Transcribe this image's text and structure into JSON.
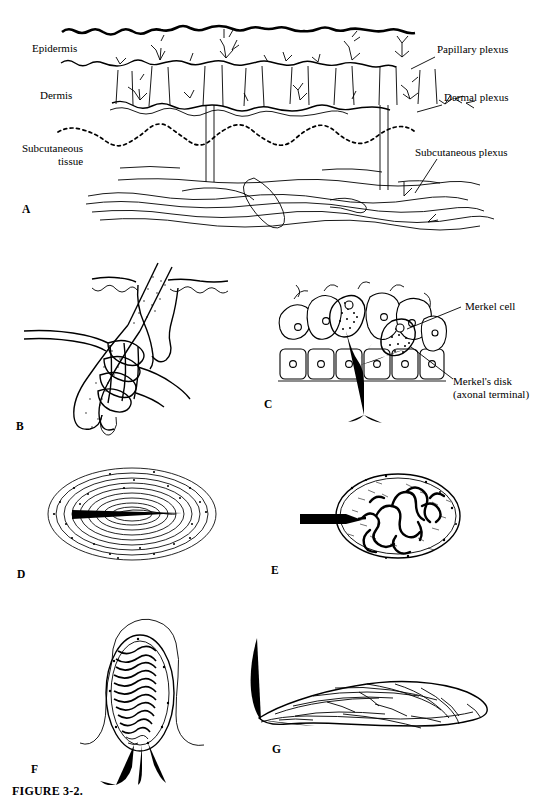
{
  "figure": {
    "caption": "FIGURE 3-2.",
    "background_color": "#ffffff",
    "ink_color": "#000000"
  },
  "panels": [
    {
      "letter": "A",
      "title": "Cutaneous nerve plexuses in skin cross-section",
      "left_labels": [
        {
          "text": "Epidermis"
        },
        {
          "text": "Dermis"
        },
        {
          "text": "Subcutaneous",
          "text2": "tissue"
        }
      ],
      "right_labels": [
        {
          "text": "Papillary plexus"
        },
        {
          "text": "Dermal plexus"
        },
        {
          "text": "Subcutaneous plexus"
        }
      ]
    },
    {
      "letter": "B",
      "title": "Hair follicle receptor"
    },
    {
      "letter": "C",
      "title": "Merkel cell complex in epidermis",
      "labels": [
        {
          "text": "Merkel cell"
        },
        {
          "text": "Merkel's disk",
          "text2": "(axonal terminal)"
        }
      ]
    },
    {
      "letter": "D",
      "title": "Pacinian corpuscle"
    },
    {
      "letter": "E",
      "title": "Ruffini ending"
    },
    {
      "letter": "F",
      "title": "Meissner corpuscle"
    },
    {
      "letter": "G",
      "title": "Free nerve ending plate receptor"
    }
  ],
  "labels": {
    "epidermis": "Epidermis",
    "dermis": "Dermis",
    "subcutaneous_line1": "Subcutaneous",
    "subcutaneous_line2": "tissue",
    "papillary_plexus": "Papillary plexus",
    "dermal_plexus": "Dermal plexus",
    "subcutaneous_plexus": "Subcutaneous plexus",
    "merkel_cell": "Merkel cell",
    "merkels_disk_line1": "Merkel's disk",
    "merkels_disk_line2": "(axonal terminal)"
  },
  "panel_letters": {
    "a": "A",
    "b": "B",
    "c": "C",
    "d": "D",
    "e": "E",
    "f": "F",
    "g": "G"
  }
}
